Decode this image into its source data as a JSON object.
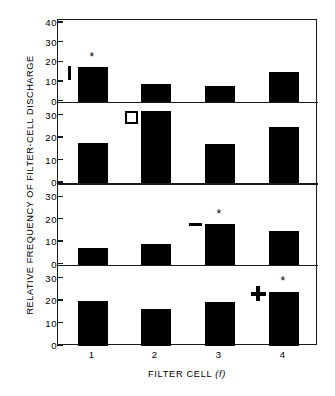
{
  "chart_data": {
    "type": "bar",
    "title": "",
    "xlabel": "FILTER CELL (f)",
    "ylabel": "RELATIVE FREQUENCY OF FILTER-CELL DISCHARGE",
    "categories": [
      "1",
      "2",
      "3",
      "4"
    ],
    "grid": false,
    "legend": "none",
    "panels": [
      {
        "name": "panel-1",
        "ylim": [
          0,
          40
        ],
        "yticks": [
          0,
          10,
          20,
          30,
          40
        ],
        "values": [
          17.5,
          9.0,
          8.0,
          15.0
        ],
        "annotations": [
          {
            "type": "vertical-bar-marker",
            "category": "1",
            "y_low": 11.0,
            "y_high": 18.0
          },
          {
            "type": "asterisk",
            "category": "1",
            "y": 21.0,
            "symbol": "*"
          }
        ]
      },
      {
        "name": "panel-2",
        "ylim": [
          0,
          35
        ],
        "yticks": [
          0,
          10,
          20,
          30
        ],
        "values": [
          18.0,
          32.0,
          17.5,
          25.0
        ],
        "annotations": [
          {
            "type": "open-square-marker",
            "category": "2",
            "y": 29.0
          },
          {
            "type": "asterisk",
            "category": "2",
            "y": 35.0,
            "symbol": "*"
          }
        ]
      },
      {
        "name": "panel-3",
        "ylim": [
          0,
          35
        ],
        "yticks": [
          0,
          10,
          20,
          30
        ],
        "values": [
          7.5,
          9.0,
          18.0,
          15.0
        ],
        "annotations": [
          {
            "type": "dash-marker",
            "category": "3",
            "y": 17.0
          },
          {
            "type": "asterisk",
            "category": "3",
            "y": 21.0,
            "symbol": "*"
          }
        ]
      },
      {
        "name": "panel-4",
        "ylim": [
          0,
          35
        ],
        "yticks": [
          0,
          10,
          20,
          30
        ],
        "values": [
          20.0,
          16.5,
          19.5,
          24.0
        ],
        "annotations": [
          {
            "type": "plus-marker",
            "category": "4",
            "y": 23.0
          },
          {
            "type": "asterisk",
            "category": "4",
            "y": 27.5,
            "symbol": "*"
          }
        ]
      }
    ],
    "colors": {
      "bar": "#000000",
      "axis": "#1a1a1a",
      "background": "#ffffff",
      "marker": "#000000"
    }
  }
}
